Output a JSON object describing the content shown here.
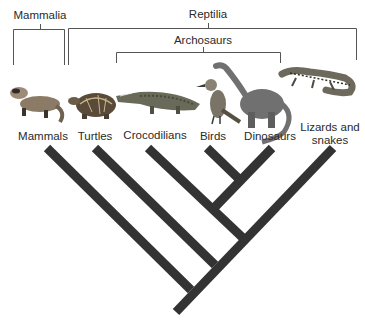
{
  "diagram": {
    "type": "cladogram",
    "groups": [
      {
        "id": "mammalia",
        "label": "Mammalia"
      },
      {
        "id": "reptilia",
        "label": "Reptilia"
      },
      {
        "id": "archosaurs",
        "label": "Archosaurs"
      }
    ],
    "taxa": [
      {
        "id": "mammals",
        "label": "Mammals",
        "image": "ferret-illustration"
      },
      {
        "id": "turtles",
        "label": "Turtles",
        "image": "turtle-illustration"
      },
      {
        "id": "crocodilians",
        "label": "Crocodilians",
        "image": "crocodile-illustration"
      },
      {
        "id": "birds",
        "label": "Birds",
        "image": "bird-illustration"
      },
      {
        "id": "dinosaurs",
        "label": "Dinosaurs",
        "image": "sauropod-illustration"
      },
      {
        "id": "lizards",
        "label_line1": "Lizards and",
        "label_line2": "snakes",
        "image": "lizard-illustration"
      }
    ],
    "colors": {
      "branch": "#333333",
      "bracket": "#555555",
      "text": "#2a2a2a"
    }
  }
}
